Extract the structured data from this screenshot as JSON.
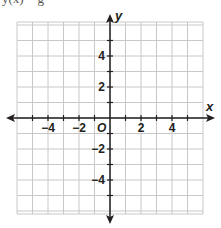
{
  "header": {
    "cut_text": "y(x) =       g"
  },
  "chart_data": {
    "type": "scatter",
    "title": "",
    "xlabel": "x",
    "ylabel": "y",
    "origin_label": "O",
    "xlim": [
      -6,
      6
    ],
    "ylim": [
      -6,
      6
    ],
    "grid": true,
    "grid_step": 1,
    "x_tick_labels": [
      {
        "value": -4,
        "label": "−4"
      },
      {
        "value": -2,
        "label": "−2"
      },
      {
        "value": 2,
        "label": "2"
      },
      {
        "value": 4,
        "label": "4"
      }
    ],
    "y_tick_labels": [
      {
        "value": 4,
        "label": "4"
      },
      {
        "value": 2,
        "label": "2"
      },
      {
        "value": -2,
        "label": "−2"
      },
      {
        "value": -4,
        "label": "−4"
      }
    ],
    "series": [],
    "colors": {
      "grid": "#c8c8c8",
      "axis": "#231f20"
    }
  }
}
